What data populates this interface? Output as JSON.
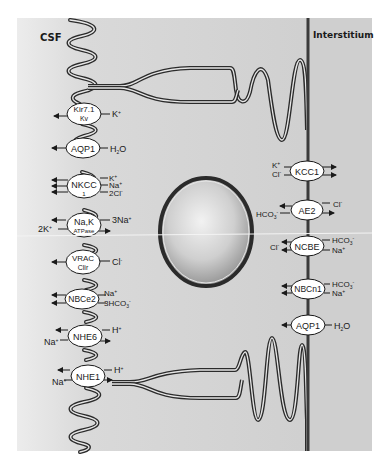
{
  "regions": {
    "left": "CSF",
    "right": "Interstitium"
  },
  "colors": {
    "panel": "#cfcfcf",
    "panel_light": "#ececec",
    "membrane": "#2b2b2b",
    "transporter_fill": "#ffffff",
    "text": "#1a1a1a"
  },
  "apical_transporters": [
    {
      "name": "Kir7.1",
      "sub": "Kv",
      "ions": [
        "K⁺"
      ]
    },
    {
      "name": "AQP1",
      "sub": "",
      "ions": [
        "H₂O"
      ]
    },
    {
      "name": "NKCC",
      "sub": "1",
      "ions": [
        "K⁺",
        "Na⁺",
        "2Cl⁻"
      ]
    },
    {
      "name": "Na,K",
      "sub": "ATPase",
      "ions": [
        "3Na⁺",
        "2K⁺"
      ]
    },
    {
      "name": "VRAC",
      "sub": "Clir",
      "ions": [
        "Cl⁻"
      ]
    },
    {
      "name": "NBCe2",
      "sub": "",
      "ions": [
        "Na⁺",
        "3HCO₃⁻"
      ]
    },
    {
      "name": "NHE6",
      "sub": "",
      "ions": [
        "H⁺",
        "Na⁺"
      ]
    },
    {
      "name": "NHE1",
      "sub": "",
      "ions": [
        "H⁺",
        "Na⁺"
      ]
    }
  ],
  "basolateral_transporters": [
    {
      "name": "KCC1",
      "ions": [
        "K⁺",
        "Cl⁻"
      ]
    },
    {
      "name": "AE2",
      "ions": [
        "Cl⁻",
        "HCO₃⁻"
      ]
    },
    {
      "name": "NCBE",
      "ions": [
        "Cl⁻",
        "HCO₃⁻",
        "Na⁺"
      ]
    },
    {
      "name": "NBCn1",
      "ions": [
        "HCO₃⁻",
        "Na⁺"
      ]
    },
    {
      "name": "AQP1",
      "ions": [
        "H₂O"
      ]
    }
  ],
  "labels": {
    "kir_name": "Kir7.1",
    "kir_sub": "Kv",
    "kir_ion": "K",
    "aqp1a_name": "AQP1",
    "aqp1a_ion": "H",
    "aqp1a_ion2": "O",
    "aqp1a_sub": "2",
    "nkcc_name": "NKCC",
    "nkcc_sub": "1",
    "nkcc_k": "K",
    "nkcc_na": "Na",
    "nkcc_cl": "2Cl",
    "nak_name": "Na,K",
    "nak_sub": "ATPase",
    "nak_na": "3Na",
    "nak_k": "2K",
    "vrac_name": "VRAC",
    "vrac_sub": "Clir",
    "vrac_cl": "Cl",
    "nbce2_name": "NBCe2",
    "nbce2_na": "Na",
    "nbce2_hco": "3HCO",
    "nbce2_sub3": "3",
    "nhe6_name": "NHE6",
    "nhe6_h": "H",
    "nhe6_na": "Na",
    "nhe1_name": "NHE1",
    "nhe1_h": "H",
    "nhe1_na": "Na",
    "kcc1_name": "KCC1",
    "kcc1_k": "K",
    "kcc1_cl": "Cl",
    "ae2_name": "AE2",
    "ae2_cl": "Cl",
    "ae2_hco": "HCO",
    "ae2_sub3": "3",
    "ncbe_name": "NCBE",
    "ncbe_cl": "Cl",
    "ncbe_hco": "HCO",
    "ncbe_sub3": "3",
    "ncbe_na": "Na",
    "nbcn1_name": "NBCn1",
    "nbcn1_hco": "HCO",
    "nbcn1_sub3": "3",
    "nbcn1_na": "Na",
    "aqp1b_name": "AQP1",
    "aqp1b_ion": "H",
    "aqp1b_ion2": "O",
    "aqp1b_sub": "2",
    "plus": "+",
    "minus": "-"
  }
}
